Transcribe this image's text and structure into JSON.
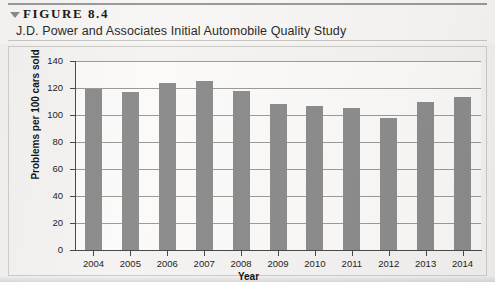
{
  "figure": {
    "marker_icon": "triangle-down-icon",
    "number_label": "FIGURE 8.4",
    "caption": "J.D. Power and Associates Initial Automobile Quality Study"
  },
  "chart_data": {
    "type": "bar",
    "title": "J.D. Power and Associates Initial Automobile Quality Study",
    "categories": [
      "2004",
      "2005",
      "2006",
      "2007",
      "2008",
      "2009",
      "2010",
      "2011",
      "2012",
      "2013",
      "2014"
    ],
    "values": [
      119,
      117,
      124,
      125,
      118,
      108,
      107,
      105,
      98,
      110,
      113
    ],
    "xlabel": "Year",
    "ylabel": "Problems per 100 cars sold",
    "ylim": [
      0,
      140
    ],
    "yticks": [
      0,
      20,
      40,
      60,
      80,
      100,
      120,
      140
    ],
    "ytick_labels": [
      "0",
      "20",
      "40",
      "60",
      "80",
      "100",
      "120",
      "140"
    ],
    "grid": true,
    "legend": "none",
    "bar_color": "#8d8d8d",
    "background_color": "#f5f3f1"
  }
}
